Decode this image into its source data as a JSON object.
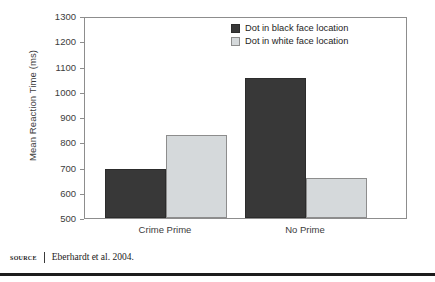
{
  "chart_data": {
    "type": "bar",
    "title": "",
    "xlabel": "",
    "ylabel": "Mean Reaction Time (ms)",
    "ylim": [
      500,
      1300
    ],
    "ytick_step": 100,
    "yticks": [
      1300,
      1200,
      1100,
      1000,
      900,
      800,
      700,
      600,
      500
    ],
    "categories": [
      "Crime Prime",
      "No Prime"
    ],
    "grid": false,
    "legend_position": "top-right",
    "series": [
      {
        "name": "Dot in black face location",
        "color": "#383838",
        "values": [
          695,
          1055
        ]
      },
      {
        "name": "Dot in white face location",
        "color": "#d5d9db",
        "values": [
          830,
          660
        ]
      }
    ]
  },
  "source": {
    "label": "SOURCE",
    "text": "Eberhardt et al. 2004."
  }
}
